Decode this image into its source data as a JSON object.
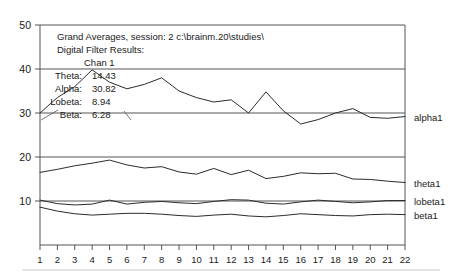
{
  "chart_data": {
    "type": "line",
    "title": "Grand Averages, session: 2 c:\\brainm.20\\studies\\",
    "subtitle": "Digital Filter Results:",
    "xlabel": "",
    "ylabel": "",
    "xlim": [
      1,
      22
    ],
    "ylim": [
      0,
      50
    ],
    "yticks": [
      10,
      20,
      30,
      40,
      50
    ],
    "grid": true,
    "legend_position": "right",
    "x": [
      1,
      2,
      3,
      4,
      5,
      6,
      7,
      8,
      9,
      10,
      11,
      12,
      13,
      14,
      15,
      16,
      17,
      18,
      19,
      20,
      21,
      22
    ],
    "categories": [
      "1",
      "2",
      "3",
      "4",
      "5",
      "6",
      "7",
      "8",
      "9",
      "10",
      "11",
      "12",
      "13",
      "14",
      "15",
      "16",
      "17",
      "18",
      "19",
      "20",
      "21",
      "22"
    ],
    "series": [
      {
        "name": "alpha1",
        "label": "alpha1",
        "values": [
          30.0,
          33.5,
          36.0,
          39.8,
          37.0,
          35.5,
          36.5,
          38.0,
          35.0,
          33.5,
          32.5,
          33.0,
          30.0,
          34.8,
          30.5,
          27.5,
          28.5,
          30.0,
          31.0,
          29.0,
          28.8,
          29.2
        ]
      },
      {
        "name": "theta1",
        "label": "theta1",
        "values": [
          16.5,
          17.2,
          18.0,
          18.6,
          19.3,
          18.2,
          17.5,
          17.8,
          16.6,
          16.1,
          17.4,
          16.0,
          17.0,
          15.1,
          15.6,
          16.4,
          16.2,
          16.3,
          15.0,
          14.9,
          14.5,
          14.2
        ]
      },
      {
        "name": "lobeta1",
        "label": "lobeta1",
        "values": [
          10.2,
          9.4,
          9.1,
          9.3,
          10.2,
          9.3,
          9.7,
          9.9,
          9.6,
          9.4,
          9.9,
          10.3,
          10.2,
          9.5,
          9.3,
          9.8,
          10.2,
          9.9,
          9.6,
          9.8,
          10.1,
          10.1
        ]
      },
      {
        "name": "beta1",
        "label": "beta1",
        "values": [
          8.6,
          7.7,
          7.1,
          6.8,
          7.0,
          7.2,
          7.2,
          7.0,
          6.7,
          6.5,
          6.8,
          7.0,
          6.6,
          6.4,
          6.7,
          7.1,
          6.9,
          6.7,
          6.6,
          6.9,
          7.0,
          6.9
        ]
      }
    ],
    "annotation": {
      "channel": "Chan 1",
      "rows": [
        {
          "key": "Theta:",
          "value": "14.43"
        },
        {
          "key": "Alpha:",
          "value": "30.82"
        },
        {
          "key": "Lobeta:",
          "value": "8.94"
        },
        {
          "key": "Beta:",
          "value": "6.28"
        }
      ]
    }
  }
}
